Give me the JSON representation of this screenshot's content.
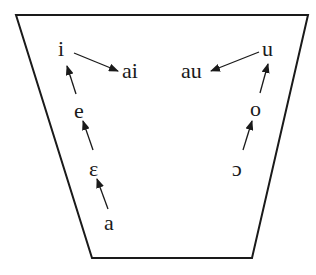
{
  "diagram": {
    "type": "vowel-chart",
    "frame": {
      "shape": "trapezoid",
      "points": [
        [
          16,
          15
        ],
        [
          308,
          15
        ],
        [
          252,
          258
        ],
        [
          92,
          258
        ]
      ],
      "stroke": "#1a1a1a"
    },
    "vowels": [
      {
        "id": "i",
        "label": "i",
        "x": 58,
        "y": 38
      },
      {
        "id": "ai",
        "label": "ai",
        "x": 122,
        "y": 60
      },
      {
        "id": "au",
        "label": "au",
        "x": 181,
        "y": 60
      },
      {
        "id": "u",
        "label": "u",
        "x": 262,
        "y": 38
      },
      {
        "id": "e",
        "label": "e",
        "x": 74,
        "y": 100
      },
      {
        "id": "o",
        "label": "o",
        "x": 250,
        "y": 98
      },
      {
        "id": "epsilon",
        "label": "ε",
        "x": 89,
        "y": 158
      },
      {
        "id": "open-o",
        "label": "ɔ",
        "x": 232,
        "y": 158
      },
      {
        "id": "a",
        "label": "a",
        "x": 104,
        "y": 212
      }
    ],
    "arrows": [
      {
        "from": "i",
        "to": "ai",
        "x1": 74,
        "y1": 53,
        "x2": 118,
        "y2": 71
      },
      {
        "from": "u",
        "to": "au",
        "x1": 259,
        "y1": 52,
        "x2": 211,
        "y2": 71
      },
      {
        "from": "e",
        "to": "i",
        "x1": 76,
        "y1": 94,
        "x2": 67,
        "y2": 66
      },
      {
        "from": "epsilon",
        "to": "e",
        "x1": 93,
        "y1": 150,
        "x2": 83,
        "y2": 121
      },
      {
        "from": "a",
        "to": "epsilon",
        "x1": 108,
        "y1": 209,
        "x2": 97,
        "y2": 179
      },
      {
        "from": "o",
        "to": "u",
        "x1": 260,
        "y1": 93,
        "x2": 268,
        "y2": 64
      },
      {
        "from": "open-o",
        "to": "o",
        "x1": 243,
        "y1": 150,
        "x2": 252,
        "y2": 121
      }
    ],
    "stroke_color": "#1a1a1a"
  }
}
